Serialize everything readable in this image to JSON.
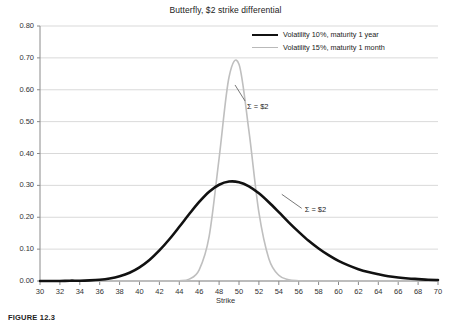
{
  "chart_data": {
    "type": "line",
    "title": "Butterfly, $2 strike differential",
    "xlabel": "Strike",
    "ylabel": "",
    "xlim": [
      30,
      70
    ],
    "ylim": [
      0.0,
      0.8
    ],
    "grid": true,
    "legend_position": "top-right",
    "x_ticks": [
      "30",
      "32",
      "34",
      "36",
      "38",
      "40",
      "42",
      "44",
      "46",
      "48",
      "50",
      "52",
      "54",
      "56",
      "58",
      "60",
      "62",
      "64",
      "66",
      "68",
      "70"
    ],
    "y_ticks": [
      "0.00",
      "0.10",
      "0.20",
      "0.30",
      "0.40",
      "0.50",
      "0.60",
      "0.70",
      "0.80"
    ],
    "x": [
      30,
      31,
      32,
      33,
      34,
      35,
      36,
      37,
      38,
      39,
      40,
      41,
      42,
      43,
      44,
      45,
      46,
      47,
      48,
      49,
      50,
      51,
      52,
      53,
      54,
      55,
      56,
      57,
      58,
      59,
      60,
      61,
      62,
      63,
      64,
      65,
      66,
      67,
      68,
      69,
      70
    ],
    "series": [
      {
        "name": "Volatility 10%, maturity 1 year",
        "color": "#111111",
        "width": 2.6,
        "values": [
          0.0,
          0.0,
          0.0,
          0.001,
          0.001,
          0.002,
          0.004,
          0.008,
          0.015,
          0.026,
          0.043,
          0.066,
          0.096,
          0.131,
          0.17,
          0.21,
          0.248,
          0.28,
          0.302,
          0.312,
          0.31,
          0.297,
          0.275,
          0.247,
          0.216,
          0.184,
          0.154,
          0.126,
          0.102,
          0.081,
          0.063,
          0.049,
          0.037,
          0.028,
          0.021,
          0.015,
          0.011,
          0.008,
          0.006,
          0.004,
          0.003
        ]
      },
      {
        "name": "Volatility 15%, maturity 1 month",
        "color": "#bfbfbf",
        "width": 1.6,
        "values": [
          0.0,
          0.0,
          0.0,
          0.0,
          0.0,
          0.0,
          0.0,
          0.0,
          0.0,
          0.0,
          0.0,
          0.0,
          0.0,
          0.0,
          0.001,
          0.006,
          0.035,
          0.14,
          0.385,
          0.64,
          0.68,
          0.47,
          0.215,
          0.07,
          0.018,
          0.004,
          0.001,
          0.0,
          0.0,
          0.0,
          0.0,
          0.0,
          0.0,
          0.0,
          0.0,
          0.0,
          0.0,
          0.0,
          0.0,
          0.0,
          0.0
        ]
      }
    ],
    "annotations": [
      {
        "text": "Σ = $2",
        "x": 50.8,
        "y": 0.545
      },
      {
        "text": "Σ = $2",
        "x": 56.6,
        "y": 0.222
      }
    ]
  },
  "caption": {
    "text": "FIGURE 12.3"
  }
}
